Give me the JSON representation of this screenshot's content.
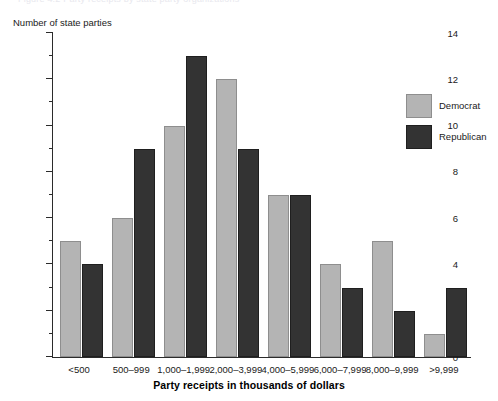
{
  "figure": {
    "caption_remnant": "Figure 4.2  Party receipts by state party organizations"
  },
  "legend": {
    "position": "inside-top-right",
    "entries": [
      {
        "label": "Democrat",
        "color": "#b4b4b4"
      },
      {
        "label": "Republican",
        "color": "#333333"
      }
    ]
  },
  "chart_data": {
    "type": "bar",
    "title": "",
    "subtitle": "",
    "xlabel": "Party receipts in thousands of dollars",
    "ylabel": "Number of state parties",
    "categories": [
      "<500",
      "500–999",
      "1,000–1,999",
      "2,000–3,999",
      "4,000–5,999",
      "6,000–7,999",
      "8,000–9,999",
      ">9,999"
    ],
    "series": [
      {
        "name": "Democrat",
        "color": "#b4b4b4",
        "values": [
          5,
          6,
          10,
          12,
          7,
          4,
          5,
          1
        ]
      },
      {
        "name": "Republican",
        "color": "#333333",
        "values": [
          4,
          9,
          13,
          9,
          7,
          3,
          2,
          3
        ]
      }
    ],
    "ylim": [
      0,
      14
    ],
    "ytick_labels": [
      "0",
      "2",
      "4",
      "6",
      "8",
      "10",
      "12",
      "14"
    ],
    "ytick_values": [
      0,
      2,
      4,
      6,
      8,
      10,
      12,
      14
    ],
    "yminor_values": [
      1,
      3,
      5,
      7,
      9,
      11,
      13
    ],
    "grid": false,
    "legend_position": "inside-top-right"
  }
}
